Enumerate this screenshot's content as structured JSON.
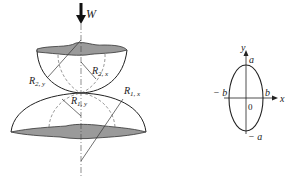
{
  "figure": {
    "left": {
      "load_label": "W",
      "labels": {
        "r2y": {
          "main": "R",
          "sub": "2, y"
        },
        "r2x": {
          "main": "R",
          "sub": "2, x"
        },
        "r1y": {
          "main": "R",
          "sub": "1, y"
        },
        "r1x": {
          "main": "R",
          "sub": "1, x"
        }
      }
    },
    "right": {
      "axis_y": "y",
      "axis_x": "x",
      "a_top": "a",
      "a_bottom": "− a",
      "b_right": "b",
      "b_left": "− b",
      "origin": "0"
    }
  }
}
